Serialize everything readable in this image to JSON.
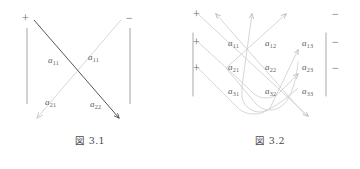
{
  "page": {
    "background": "#ffffff",
    "ink": "#5c5c5c",
    "arrow_dark": "#4d4d4d",
    "arrow_light": "#d8d8d8",
    "bar_color": "#9a9a9a"
  },
  "figures": [
    {
      "id": "fig-3-1",
      "caption": "図 3.1",
      "matrix_order": 2,
      "signs": {
        "plus": [
          "+"
        ],
        "minus": [
          "−"
        ]
      },
      "entries": [
        {
          "label": "a",
          "sub": "11",
          "row": 1,
          "col": 1,
          "x": 48,
          "y": 55
        },
        {
          "label": "a",
          "sub": "11",
          "row": 1,
          "col": 2,
          "x": 88,
          "y": 52
        },
        {
          "label": "a",
          "sub": "21",
          "row": 2,
          "col": 1,
          "x": 45,
          "y": 97
        },
        {
          "label": "a",
          "sub": "22",
          "row": 2,
          "col": 2,
          "x": 90,
          "y": 99
        }
      ],
      "arrows": [
        {
          "name": "main-diagonal-plus",
          "from": "top-left",
          "to": "bottom-right",
          "color": "dark",
          "sign": "+"
        },
        {
          "name": "anti-diagonal-minus",
          "from": "top-right",
          "to": "bottom-left",
          "color": "light",
          "sign": "−"
        }
      ]
    },
    {
      "id": "fig-3-2",
      "caption": "図 3.2",
      "matrix_order": 3,
      "signs": {
        "plus": [
          "+",
          "+",
          "+"
        ],
        "minus": [
          "−",
          "−",
          "−"
        ]
      },
      "entries": [
        {
          "label": "a",
          "sub": "11",
          "row": 1,
          "col": 1,
          "x": 20,
          "y": 38
        },
        {
          "label": "a",
          "sub": "12",
          "row": 1,
          "col": 2,
          "x": 57,
          "y": 38
        },
        {
          "label": "a",
          "sub": "13",
          "row": 1,
          "col": 3,
          "x": 94,
          "y": 38
        },
        {
          "label": "a",
          "sub": "21",
          "row": 2,
          "col": 1,
          "x": 20,
          "y": 62
        },
        {
          "label": "a",
          "sub": "22",
          "row": 2,
          "col": 2,
          "x": 57,
          "y": 62
        },
        {
          "label": "a",
          "sub": "23",
          "row": 2,
          "col": 3,
          "x": 94,
          "y": 62
        },
        {
          "label": "a",
          "sub": "31",
          "row": 3,
          "col": 1,
          "x": 20,
          "y": 86
        },
        {
          "label": "a",
          "sub": "32",
          "row": 3,
          "col": 2,
          "x": 57,
          "y": 86
        },
        {
          "label": "a",
          "sub": "33",
          "row": 3,
          "col": 3,
          "x": 94,
          "y": 86
        }
      ],
      "arrows": [
        {
          "name": "down-right-diagonal-1",
          "direction": "down-right",
          "color": "light",
          "sign": "−"
        },
        {
          "name": "down-right-diagonal-2",
          "direction": "down-right",
          "color": "light",
          "sign": "−"
        },
        {
          "name": "down-right-diagonal-3",
          "direction": "down-right",
          "color": "light",
          "sign": "−"
        },
        {
          "name": "up-right-diagonal-1",
          "direction": "up-right",
          "color": "light",
          "sign": "+"
        },
        {
          "name": "up-right-diagonal-2",
          "direction": "up-right",
          "color": "light",
          "sign": "+"
        },
        {
          "name": "up-right-diagonal-3",
          "direction": "up-right",
          "color": "light",
          "sign": "+"
        }
      ]
    }
  ]
}
